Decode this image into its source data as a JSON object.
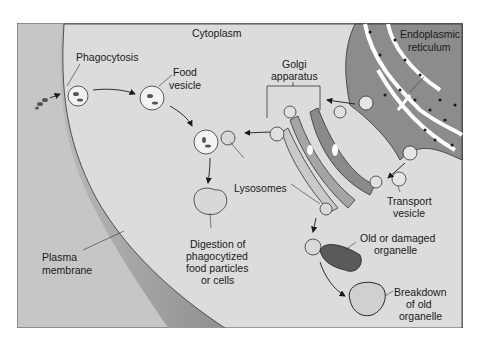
{
  "diagram": {
    "title_region": "Cytoplasm",
    "labels": {
      "cytoplasm": "Cytoplasm",
      "phagocytosis": "Phagocytosis",
      "food_vesicle_1": "Food",
      "food_vesicle_2": "vesicle",
      "golgi_1": "Golgi",
      "golgi_2": "apparatus",
      "er_1": "Endoplasmic",
      "er_2": "reticulum",
      "lysosomes": "Lysosomes",
      "transport_1": "Transport",
      "transport_2": "vesicle",
      "digestion_1": "Digestion of",
      "digestion_2": "phagocytized",
      "digestion_3": "food particles",
      "digestion_4": "or cells",
      "plasma_1": "Plasma",
      "plasma_2": "membrane",
      "old_1": "Old or damaged",
      "old_2": "organelle",
      "breakdown_1": "Breakdown",
      "breakdown_2": "of old",
      "breakdown_3": "organelle"
    },
    "colors": {
      "background": "#ffffff",
      "cytoplasm": "#dcdcdc",
      "extracellular": "#c4c4c4",
      "membrane": "#a8a8a8",
      "organelle_dark": "#8a8a8a",
      "outline": "#2a2a2a"
    }
  }
}
